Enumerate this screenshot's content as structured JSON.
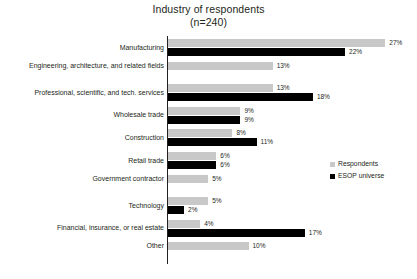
{
  "chart_data": {
    "type": "bar",
    "orientation": "horizontal",
    "title": "Industry of respondents",
    "subtitle": "(n=240)",
    "xlabel": "",
    "ylabel": "",
    "grid": false,
    "legend_position": "right",
    "value_suffix": "%",
    "xlim": [
      0,
      30
    ],
    "categories": [
      "Manufacturing",
      "Engineering, architecture, and related fields",
      "Professional, scientific, and tech. services",
      "Wholesale trade",
      "Construction",
      "Retail trade",
      "Government contractor",
      "Technology",
      "Financial, insurance, or real estate",
      "Other"
    ],
    "series": [
      {
        "name": "Respondents",
        "color": "#c8c8c8",
        "values": [
          27,
          13,
          13,
          9,
          8,
          6,
          5,
          5,
          4,
          10
        ],
        "labels": [
          "27%",
          "13%",
          "13%",
          "9%",
          "8%",
          "6%",
          "5%",
          "5%",
          "4%",
          "10%"
        ]
      },
      {
        "name": "ESOP universe",
        "color": "#000000",
        "values": [
          22,
          null,
          18,
          9,
          11,
          6,
          null,
          2,
          17,
          null
        ],
        "labels": [
          "22%",
          null,
          "18%",
          "9%",
          "11%",
          "6%",
          null,
          "2%",
          "17%",
          null
        ]
      }
    ]
  },
  "legend": {
    "items": [
      {
        "label": "Respondents",
        "swatch": "resp"
      },
      {
        "label": "ESOP universe",
        "swatch": "esop"
      }
    ]
  }
}
